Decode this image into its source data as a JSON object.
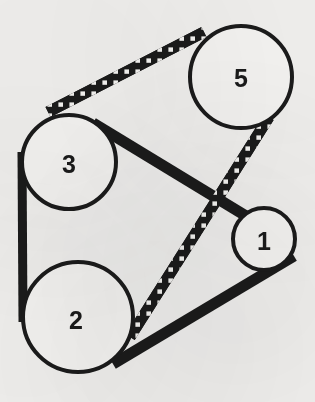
{
  "figure": {
    "kind": "mechanical-diagram",
    "background_color": "#f2f1ef",
    "ink_color": "#1b1b1b",
    "width": 315,
    "height": 402
  },
  "pulleys": [
    {
      "id": "pulley-5",
      "label": "5",
      "cx": 241,
      "cy": 77,
      "r": 51,
      "stroke_width": 4,
      "fill": "#f6f5f3",
      "label_x": 241,
      "label_y": 78
    },
    {
      "id": "pulley-3",
      "label": "3",
      "cx": 69,
      "cy": 162,
      "r": 47,
      "stroke_width": 4,
      "fill": "#f6f5f3",
      "label_x": 69,
      "label_y": 164
    },
    {
      "id": "pulley-2",
      "label": "2",
      "cx": 78,
      "cy": 317,
      "r": 55,
      "stroke_width": 4,
      "fill": "#f6f5f3",
      "label_x": 76,
      "label_y": 320
    },
    {
      "id": "pulley-1",
      "label": "1",
      "cx": 264,
      "cy": 239,
      "r": 31,
      "stroke_width": 4,
      "fill": "#f6f5f3",
      "label_x": 264,
      "label_y": 241
    }
  ],
  "belts": [
    {
      "id": "belt-3-to-5-toothed",
      "style": "toothed",
      "from": "pulley-3",
      "to": "pulley-5",
      "x1": 50,
      "y1": 111,
      "x2": 201,
      "y2": 34,
      "width": 11
    },
    {
      "id": "belt-5-to-2-toothed",
      "style": "toothed",
      "from": "pulley-5",
      "to": "pulley-2",
      "x1": 266,
      "y1": 121,
      "x2": 133,
      "y2": 333,
      "width": 11
    },
    {
      "id": "belt-3-to-1-solid",
      "style": "solid",
      "from": "pulley-3",
      "to": "pulley-1",
      "x1": 96,
      "y1": 125,
      "x2": 242,
      "y2": 214,
      "width": 11
    },
    {
      "id": "belt-1-to-2-solid",
      "style": "solid",
      "from": "pulley-1",
      "to": "pulley-2",
      "x1": 291,
      "y1": 257,
      "x2": 118,
      "y2": 361,
      "width": 11
    },
    {
      "id": "belt-3-to-2-left-solid",
      "style": "solid",
      "from": "pulley-3",
      "to": "pulley-2",
      "x1": 22,
      "y1": 156,
      "x2": 23,
      "y2": 318,
      "width": 9
    }
  ]
}
